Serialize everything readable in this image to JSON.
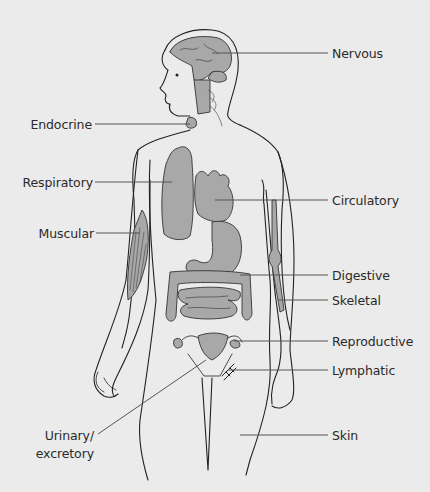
{
  "diagram": {
    "colors": {
      "background": "#ebebeb",
      "organ_fill": "#a8a8a8",
      "outline": "#222222",
      "leader": "#555555"
    },
    "labels": {
      "nervous": "Nervous",
      "endocrine": "Endocrine",
      "respiratory": "Respiratory",
      "circulatory": "Circulatory",
      "muscular": "Muscular",
      "digestive": "Digestive",
      "skeletal": "Skeletal",
      "reproductive": "Reproductive",
      "lymphatic": "Lymphatic",
      "skin": "Skin",
      "urinary_line1": "Urinary/",
      "urinary_line2": "excretory"
    }
  }
}
